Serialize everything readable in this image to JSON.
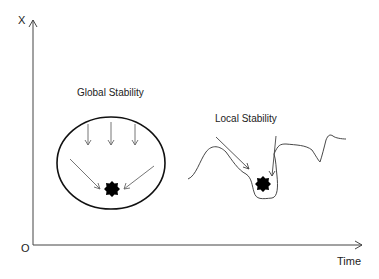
{
  "axes": {
    "y_label": "X",
    "x_label": "Time",
    "origin_label": "O"
  },
  "panels": {
    "global": {
      "title": "Global Stability"
    },
    "local": {
      "title": "Local Stability"
    }
  },
  "colors": {
    "line": "#333333",
    "arrow": "#555555",
    "ball": "#000000"
  }
}
